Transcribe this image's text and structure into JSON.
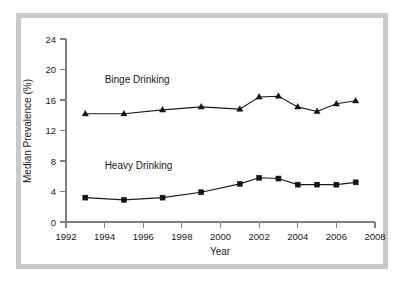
{
  "chart_data": {
    "type": "line",
    "title": "",
    "xlabel": "Year",
    "ylabel": "Median Prevalence (%)",
    "xlim": [
      1992,
      2008
    ],
    "ylim": [
      0,
      24
    ],
    "xticks": [
      1992,
      1994,
      1996,
      1998,
      2000,
      2002,
      2004,
      2006,
      2008
    ],
    "xtick_labels": [
      "1992",
      "1994",
      "1996",
      "1998",
      "2000",
      "2002",
      "2004",
      "2006",
      "2008"
    ],
    "yticks": [
      0,
      4,
      8,
      12,
      16,
      20,
      24
    ],
    "ytick_labels": [
      "0",
      "4",
      "8",
      "12",
      "16",
      "20",
      "24"
    ],
    "grid": false,
    "legend_position": "inline-annotations",
    "x": [
      1993,
      1995,
      1997,
      1999,
      2001,
      2002,
      2003,
      2004,
      2005,
      2006,
      2007
    ],
    "series": [
      {
        "name": "Binge Drinking",
        "marker": "triangle",
        "color": "#141414",
        "values": [
          14.2,
          14.2,
          14.7,
          15.1,
          14.8,
          16.4,
          16.5,
          15.1,
          14.5,
          15.5,
          15.9
        ],
        "annotation": {
          "text": "Binge Drinking",
          "x": 1994.0,
          "y": 18.2
        }
      },
      {
        "name": "Heavy Drinking",
        "marker": "square",
        "color": "#141414",
        "values": [
          3.2,
          2.9,
          3.2,
          3.9,
          5.0,
          5.8,
          5.7,
          4.9,
          4.9,
          4.9,
          5.2
        ],
        "annotation": {
          "text": "Heavy Drinking",
          "x": 1994.0,
          "y": 7.0
        }
      }
    ]
  },
  "figure": {
    "frame_color": "#c9c9c9",
    "background": "#ffffff",
    "axis_color": "#808080",
    "data_color": "#141414"
  }
}
